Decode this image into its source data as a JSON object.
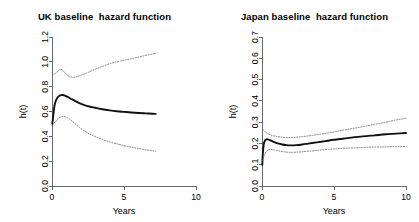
{
  "figure": {
    "background": "#ffffff",
    "panel_count": 2
  },
  "chart_data": [
    {
      "type": "line",
      "panel": "uk",
      "title": "UK baseline  hazard function",
      "xlabel": "Years",
      "ylabel": "h(t)",
      "xlim": [
        0,
        10
      ],
      "ylim": [
        0.0,
        1.2
      ],
      "xticks": [
        0,
        5,
        10
      ],
      "xticklabels": [
        "0",
        "5",
        "10"
      ],
      "yticks": [
        0.0,
        0.2,
        0.4,
        0.6,
        0.8,
        1.0,
        1.2
      ],
      "yticklabels": [
        "0.0",
        "0.2",
        "0.4",
        "0.6",
        "0.8",
        "1.0",
        "1.2"
      ],
      "grid": false,
      "legend": null,
      "series": [
        {
          "name": "baseline hazard",
          "style": "solid",
          "color": "#111111",
          "x": [
            0.02,
            0.08,
            0.15,
            0.22,
            0.3,
            0.4,
            0.5,
            0.62,
            0.75,
            0.9,
            1.05,
            1.2,
            1.4,
            1.6,
            1.9,
            2.2,
            2.6,
            3.0,
            3.5,
            4.0,
            4.5,
            5.0,
            5.5,
            6.0,
            6.5,
            7.0,
            7.2
          ],
          "y": [
            0.5,
            0.56,
            0.63,
            0.67,
            0.695,
            0.715,
            0.725,
            0.732,
            0.733,
            0.728,
            0.72,
            0.71,
            0.697,
            0.685,
            0.668,
            0.654,
            0.64,
            0.63,
            0.618,
            0.609,
            0.602,
            0.597,
            0.592,
            0.588,
            0.585,
            0.582,
            0.581
          ]
        },
        {
          "name": "upper 95% confidence limit",
          "style": "dotted",
          "color": "#6e6e6e",
          "x": [
            0.02,
            0.1,
            0.2,
            0.3,
            0.42,
            0.55,
            0.7,
            0.85,
            1.0,
            1.15,
            1.3,
            1.5,
            1.7,
            1.9,
            2.2,
            2.5,
            3.0,
            3.5,
            4.0,
            4.5,
            5.0,
            5.5,
            6.0,
            6.5,
            7.0,
            7.2
          ],
          "y": [
            0.895,
            0.9,
            0.905,
            0.912,
            0.925,
            0.94,
            0.935,
            0.918,
            0.9,
            0.885,
            0.878,
            0.875,
            0.88,
            0.888,
            0.9,
            0.915,
            0.94,
            0.963,
            0.985,
            1.0,
            1.013,
            1.025,
            1.038,
            1.052,
            1.063,
            1.068
          ]
        },
        {
          "name": "lower 95% confidence limit",
          "style": "dotted",
          "color": "#6e6e6e",
          "x": [
            0.02,
            0.1,
            0.2,
            0.32,
            0.45,
            0.6,
            0.75,
            0.9,
            1.05,
            1.2,
            1.4,
            1.6,
            1.9,
            2.2,
            2.6,
            3.0,
            3.5,
            4.0,
            4.5,
            5.0,
            5.5,
            6.0,
            6.5,
            7.0,
            7.2
          ],
          "y": [
            0.49,
            0.5,
            0.515,
            0.53,
            0.545,
            0.555,
            0.56,
            0.558,
            0.55,
            0.54,
            0.522,
            0.503,
            0.472,
            0.447,
            0.42,
            0.398,
            0.375,
            0.355,
            0.34,
            0.325,
            0.313,
            0.302,
            0.292,
            0.283,
            0.28
          ]
        }
      ]
    },
    {
      "type": "line",
      "panel": "japan",
      "title": "Japan baseline  hazard function",
      "xlabel": "Years",
      "ylabel": "h(t)",
      "xlim": [
        0,
        10
      ],
      "ylim": [
        0.0,
        0.7
      ],
      "xticks": [
        0,
        5,
        10
      ],
      "xticklabels": [
        "0",
        "5",
        "10"
      ],
      "yticks": [
        0.0,
        0.1,
        0.2,
        0.3,
        0.4,
        0.5,
        0.6,
        0.7
      ],
      "yticklabels": [
        "0.0",
        "0.1",
        "0.2",
        "0.3",
        "0.4",
        "0.5",
        "0.6",
        "0.7"
      ],
      "grid": false,
      "legend": null,
      "series": [
        {
          "name": "baseline hazard",
          "style": "solid",
          "color": "#111111",
          "x": [
            0.02,
            0.06,
            0.12,
            0.2,
            0.3,
            0.42,
            0.55,
            0.7,
            0.9,
            1.1,
            1.4,
            1.7,
            2.0,
            2.4,
            2.8,
            3.2,
            3.8,
            4.4,
            5.0,
            5.6,
            6.2,
            7.0,
            7.8,
            8.6,
            9.3,
            10.0
          ],
          "y": [
            0.1,
            0.155,
            0.195,
            0.213,
            0.219,
            0.219,
            0.216,
            0.211,
            0.205,
            0.2,
            0.195,
            0.192,
            0.191,
            0.192,
            0.195,
            0.199,
            0.205,
            0.211,
            0.217,
            0.222,
            0.227,
            0.233,
            0.238,
            0.243,
            0.246,
            0.249
          ]
        },
        {
          "name": "upper 95% confidence limit",
          "style": "dotted",
          "color": "#6e6e6e",
          "x": [
            0.05,
            0.12,
            0.2,
            0.3,
            0.45,
            0.6,
            0.8,
            1.0,
            1.3,
            1.6,
            2.0,
            2.4,
            2.8,
            3.3,
            3.8,
            4.4,
            5.0,
            5.6,
            6.3,
            7.0,
            7.8,
            8.6,
            9.3,
            10.0
          ],
          "y": [
            0.268,
            0.262,
            0.256,
            0.25,
            0.244,
            0.24,
            0.236,
            0.233,
            0.23,
            0.228,
            0.228,
            0.229,
            0.232,
            0.236,
            0.241,
            0.247,
            0.254,
            0.262,
            0.27,
            0.279,
            0.289,
            0.3,
            0.31,
            0.318
          ]
        },
        {
          "name": "lower 95% confidence limit",
          "style": "dotted",
          "color": "#6e6e6e",
          "x": [
            0.05,
            0.12,
            0.2,
            0.3,
            0.45,
            0.6,
            0.8,
            1.0,
            1.3,
            1.6,
            2.0,
            2.4,
            2.8,
            3.3,
            3.8,
            4.4,
            5.0,
            5.6,
            6.3,
            7.0,
            7.8,
            8.6,
            9.3,
            10.0
          ],
          "y": [
            0.118,
            0.135,
            0.15,
            0.162,
            0.17,
            0.172,
            0.17,
            0.167,
            0.163,
            0.16,
            0.158,
            0.159,
            0.161,
            0.164,
            0.167,
            0.171,
            0.174,
            0.177,
            0.179,
            0.181,
            0.183,
            0.184,
            0.185,
            0.186
          ]
        }
      ]
    }
  ]
}
